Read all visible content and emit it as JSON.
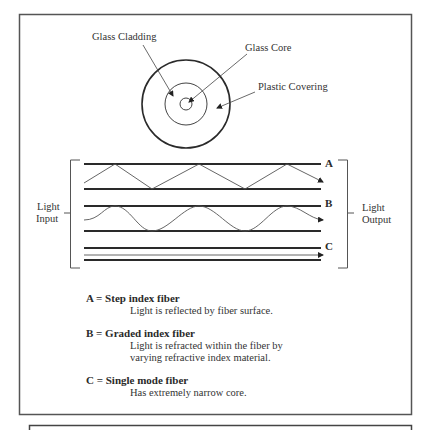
{
  "diagram": {
    "cross_section": {
      "labels": {
        "cladding": "Glass Cladding",
        "core": "Glass Core",
        "covering": "Plastic Covering"
      }
    },
    "side_labels": {
      "input_line1": "Light",
      "input_line2": "Input",
      "output_line1": "Light",
      "output_line2": "Output"
    },
    "fibers": [
      {
        "letter": "A",
        "path_type": "zigzag"
      },
      {
        "letter": "B",
        "path_type": "sinusoid"
      },
      {
        "letter": "C",
        "path_type": "straight"
      }
    ],
    "legend": [
      {
        "heading": "A = Step index fiber",
        "lines": [
          "Light is reflected by fiber surface."
        ]
      },
      {
        "heading": "B = Graded index fiber",
        "lines": [
          "Light is refracted within the fiber by",
          "varying refractive index material."
        ]
      },
      {
        "heading": "C = Single mode fiber",
        "lines": [
          "Has extremely narrow core."
        ]
      }
    ],
    "colors": {
      "stroke": "#2a2a2a",
      "light_path": "#555555",
      "frame": "#555555"
    }
  }
}
